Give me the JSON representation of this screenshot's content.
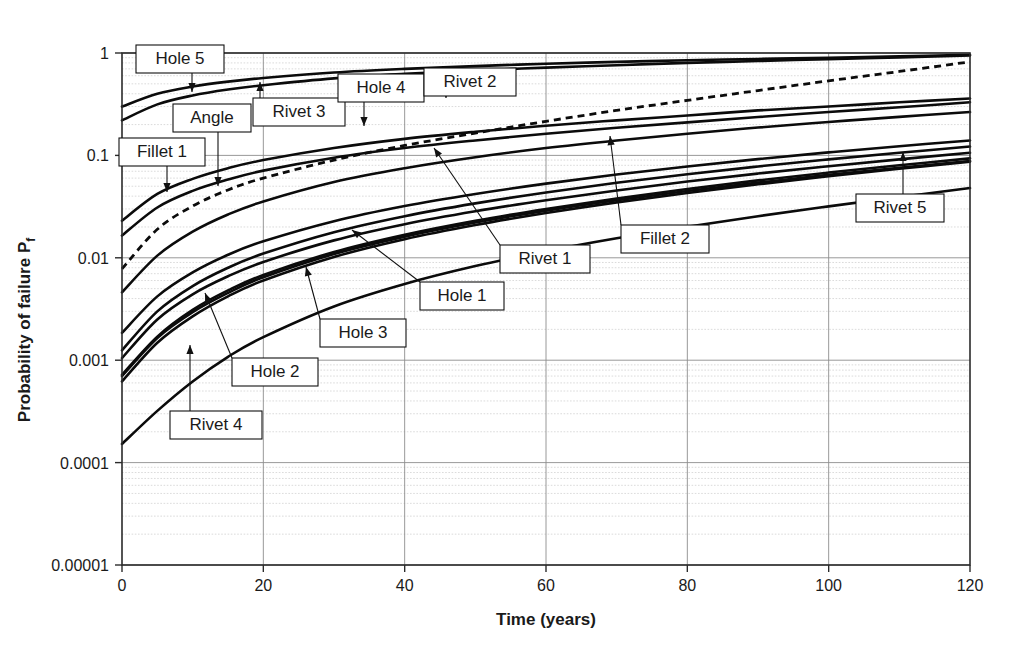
{
  "chart_data": {
    "type": "line",
    "title": "",
    "xlabel": "Time (years)",
    "ylabel": "Probability of failure Pf",
    "ylabel_main": "Probability of failure P",
    "ylabel_sub": "f",
    "xlim": [
      0,
      120
    ],
    "ylim": [
      1e-05,
      1
    ],
    "yscale": "log",
    "xscale": "linear",
    "grid": "major and minor horizontal log gridlines, major vertical gridlines at every 20 years",
    "legend": "none (inline boxed callout labels with leader lines)",
    "xticks": [
      0,
      20,
      40,
      60,
      80,
      100,
      120
    ],
    "xtick_labels": [
      "0",
      "20",
      "40",
      "60",
      "80",
      "100",
      "120"
    ],
    "yticks": [
      1,
      0.1,
      0.01,
      0.001,
      0.0001,
      1e-05
    ],
    "ytick_labels": [
      "1",
      "0.1",
      "0.01",
      "0.001",
      "0.0001",
      "0.00001"
    ],
    "x": [
      0,
      5,
      10,
      15,
      20,
      30,
      40,
      50,
      60,
      70,
      80,
      90,
      100,
      110,
      120
    ],
    "series": [
      {
        "name": "Hole 5",
        "style": "solid",
        "values": [
          0.3,
          0.4,
          0.47,
          0.525,
          0.57,
          0.645,
          0.7,
          0.745,
          0.785,
          0.82,
          0.85,
          0.875,
          0.9,
          0.93,
          0.96
        ]
      },
      {
        "name": "Rivet 3",
        "style": "solid",
        "values": [
          0.22,
          0.315,
          0.385,
          0.44,
          0.485,
          0.565,
          0.625,
          0.675,
          0.72,
          0.76,
          0.8,
          0.835,
          0.87,
          0.905,
          0.945
        ]
      },
      {
        "name": "Fillet 1",
        "style": "solid",
        "values": [
          0.023,
          0.042,
          0.059,
          0.075,
          0.09,
          0.118,
          0.145,
          0.17,
          0.195,
          0.22,
          0.245,
          0.275,
          0.3,
          0.33,
          0.36
        ]
      },
      {
        "name": "Angle",
        "style": "solid",
        "values": [
          0.0165,
          0.031,
          0.045,
          0.058,
          0.071,
          0.095,
          0.118,
          0.14,
          0.163,
          0.186,
          0.21,
          0.237,
          0.265,
          0.295,
          0.33
        ]
      },
      {
        "name": "Rivet 2",
        "style": "dashed",
        "values": [
          0.0078,
          0.019,
          0.032,
          0.046,
          0.06,
          0.09,
          0.125,
          0.165,
          0.215,
          0.275,
          0.345,
          0.43,
          0.535,
          0.66,
          0.82
        ]
      },
      {
        "name": "Hole 4",
        "style": "solid",
        "values": [
          0.0046,
          0.0105,
          0.018,
          0.0265,
          0.0355,
          0.055,
          0.075,
          0.096,
          0.118,
          0.14,
          0.163,
          0.187,
          0.212,
          0.238,
          0.265
        ]
      },
      {
        "name": "Hole 1",
        "style": "solid",
        "values": [
          0.00185,
          0.0042,
          0.0072,
          0.0107,
          0.0145,
          0.0228,
          0.032,
          0.042,
          0.053,
          0.065,
          0.078,
          0.092,
          0.107,
          0.123,
          0.14
        ]
      },
      {
        "name": "Rivet 1",
        "style": "solid",
        "values": [
          0.00125,
          0.003,
          0.0053,
          0.008,
          0.011,
          0.0178,
          0.0255,
          0.034,
          0.0435,
          0.054,
          0.0655,
          0.078,
          0.0915,
          0.106,
          0.122
        ]
      },
      {
        "name": "Hole 3",
        "style": "solid",
        "values": [
          0.00105,
          0.0025,
          0.0044,
          0.0066,
          0.0091,
          0.0148,
          0.0213,
          0.0285,
          0.0365,
          0.0455,
          0.0555,
          0.0665,
          0.0785,
          0.0915,
          0.106
        ]
      },
      {
        "name": "Hole 2",
        "style": "solid",
        "values": [
          0.00072,
          0.0017,
          0.0031,
          0.0048,
          0.0068,
          0.0114,
          0.0168,
          0.023,
          0.03,
          0.038,
          0.047,
          0.057,
          0.068,
          0.08,
          0.0935
        ]
      },
      {
        "name": "Fillet 2",
        "style": "solid",
        "values": [
          0.00062,
          0.00148,
          0.00268,
          0.0042,
          0.006,
          0.0102,
          0.0152,
          0.0209,
          0.0274,
          0.0348,
          0.043,
          0.0522,
          0.0625,
          0.074,
          0.087
        ]
      },
      {
        "name": "Rivet 4",
        "style": "solid",
        "values": [
          0.0007,
          0.00165,
          0.00295,
          0.00455,
          0.00645,
          0.0109,
          0.0161,
          0.0221,
          0.0289,
          0.0365,
          0.0449,
          0.0542,
          0.0645,
          0.0758,
          0.0883
        ]
      },
      {
        "name": "Rivet 5",
        "style": "solid",
        "values": [
          0.000152,
          0.00032,
          0.00062,
          0.00108,
          0.00168,
          0.00335,
          0.00555,
          0.0083,
          0.0116,
          0.0155,
          0.0201,
          0.0255,
          0.0318,
          0.0392,
          0.048
        ]
      }
    ],
    "annotations": [
      {
        "label": "Hole 5",
        "box": [
          136,
          45,
          88,
          28
        ],
        "tip": [
          192,
          92
        ]
      },
      {
        "label": "Angle",
        "box": [
          173,
          104,
          78,
          28
        ],
        "tip": [
          218,
          186
        ]
      },
      {
        "label": "Rivet 3",
        "box": [
          253,
          98,
          92,
          28
        ],
        "tip": [
          260,
          82
        ]
      },
      {
        "label": "Hole 4",
        "box": [
          338,
          74,
          86,
          28
        ],
        "tip": [
          364,
          126
        ]
      },
      {
        "label": "Rivet 2",
        "box": [
          424,
          68,
          92,
          28
        ],
        "tip": [
          446,
          98
        ]
      },
      {
        "label": "Fillet 1",
        "box": [
          119,
          138,
          86,
          28
        ],
        "tip": [
          167,
          192
        ]
      },
      {
        "label": "Fillet 2",
        "box": [
          621,
          225,
          88,
          28
        ],
        "tip": [
          610,
          136
        ]
      },
      {
        "label": "Rivet 1",
        "box": [
          500,
          245,
          90,
          28
        ],
        "tip": [
          434,
          148
        ]
      },
      {
        "label": "Hole 1",
        "box": [
          420,
          282,
          84,
          28
        ],
        "tip": [
          352,
          230
        ]
      },
      {
        "label": "Hole 3",
        "box": [
          320,
          319,
          86,
          28
        ],
        "tip": [
          306,
          267
        ]
      },
      {
        "label": "Hole 2",
        "box": [
          232,
          358,
          86,
          28
        ],
        "tip": [
          205,
          293
        ]
      },
      {
        "label": "Rivet 4",
        "box": [
          170,
          411,
          92,
          28
        ],
        "tip": [
          190,
          345
        ]
      },
      {
        "label": "Rivet 5",
        "box": [
          856,
          194,
          88,
          28
        ],
        "tip": [
          903,
          152
        ]
      }
    ]
  },
  "plot": {
    "left": 122,
    "right": 970,
    "top": 53,
    "bottom": 565
  }
}
